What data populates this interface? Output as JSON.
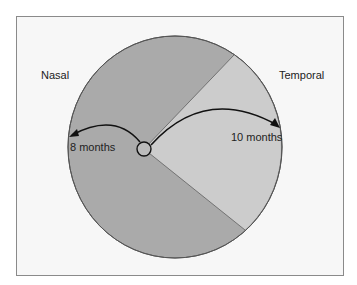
{
  "diagram": {
    "labels": {
      "nasal": "Nasal",
      "temporal": "Temporal",
      "nasal_duration": "8 months",
      "temporal_duration": "10 months"
    },
    "colors": {
      "background": "#f7f7f7",
      "frame_border": "#8a8a8a",
      "nasal_region": "#aaaaaa",
      "temporal_region": "#cccccc",
      "outline": "#555555",
      "arrows": "#111111"
    }
  }
}
